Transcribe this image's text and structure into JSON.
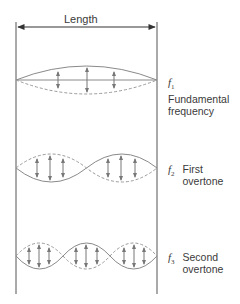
{
  "title_arrow": {
    "label": "Length"
  },
  "modes": [
    {
      "symbol": "f",
      "subscript": "1",
      "line1": "Fundamental",
      "line2": "frequency",
      "loops": 1
    },
    {
      "symbol": "f",
      "subscript": "2",
      "line1": "First",
      "line2": "overtone",
      "loops": 2
    },
    {
      "symbol": "f",
      "subscript": "3",
      "line1": "Second",
      "line2": "overtone",
      "loops": 3
    }
  ],
  "colors": {
    "boundary": "#555555",
    "wave_solid": "#8a8a8a",
    "wave_dashed": "#9a9a9a",
    "arrows": "#777777",
    "text": "#3a3a3a"
  }
}
